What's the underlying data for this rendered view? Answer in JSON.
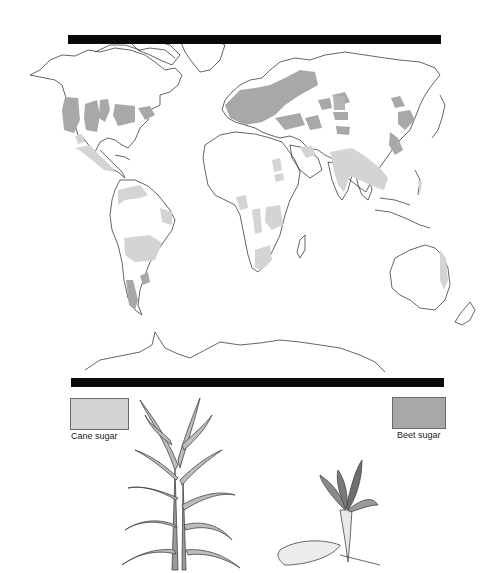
{
  "map": {
    "title_bar_top": "",
    "projection": "world",
    "colors": {
      "land_outline": "#222222",
      "cane_sugar_fill": "#d4d4d4",
      "beet_sugar_fill": "#a8a8a8",
      "header_bar": "#0a0a0a"
    },
    "regions": {
      "beet_sugar": [
        "Western USA",
        "US Great Plains",
        "Great Lakes region",
        "Eastern Canada",
        "Europe",
        "Ukraine/Southern Russia",
        "Central Asia",
        "Northern China",
        "Manchuria",
        "Japan/Korea",
        "Chile",
        "Uruguay"
      ],
      "cane_sugar": [
        "Mexico",
        "Central America",
        "Caribbean",
        "Northern South America",
        "Brazil",
        "Argentina",
        "West Africa",
        "Central/East Africa",
        "Southern Africa",
        "Egypt/Sudan",
        "Middle East",
        "India",
        "Southeast Asia",
        "Indonesia/Philippines",
        "Queensland Australia"
      ]
    }
  },
  "legend": {
    "cane": {
      "label": "Cane sugar",
      "color": "#d4d4d4"
    },
    "beet": {
      "label": "Beet sugar",
      "color": "#a8a8a8"
    }
  },
  "illustrations": {
    "cane_plant": "sugar-cane-plant",
    "beet_root": "sugar-beet-root"
  }
}
